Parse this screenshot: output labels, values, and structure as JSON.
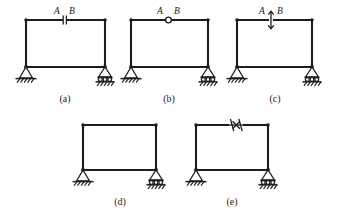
{
  "figure": {
    "background_color": "#ffffff",
    "line_color": "#1d1d1d",
    "panels": [
      {
        "id": "panel-a",
        "caption": "(a)",
        "release_type": "double-vertical-bar",
        "release_name": "shear-release-symbol",
        "left_label": "A",
        "right_label": "B",
        "left_support": "pinned",
        "right_support": "roller"
      },
      {
        "id": "panel-b",
        "caption": "(b)",
        "release_type": "hinge-circle",
        "release_name": "moment-hinge-symbol",
        "left_label": "A",
        "right_label": "B",
        "left_support": "pinned",
        "right_support": "roller"
      },
      {
        "id": "panel-c",
        "caption": "(c)",
        "release_type": "vertical-double-arrow",
        "release_name": "vertical-slider-symbol",
        "left_label": "A",
        "right_label": "B",
        "left_support": "pinned",
        "right_support": "roller"
      },
      {
        "id": "panel-d",
        "caption": "(d)",
        "release_type": "none",
        "release_name": "rigid-joint",
        "left_label": "",
        "right_label": "",
        "left_support": "pinned",
        "right_support": "roller"
      },
      {
        "id": "panel-e",
        "caption": "(e)",
        "release_type": "horizontal-double-arrow",
        "release_name": "axial-release-symbol",
        "left_label": "",
        "right_label": "",
        "left_support": "pinned",
        "right_support": "roller"
      }
    ]
  }
}
